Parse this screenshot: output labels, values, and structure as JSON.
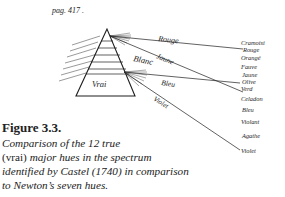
{
  "page_label": "pag. 417 .",
  "diagram": {
    "prism_label": "Vrai",
    "beam_labels": {
      "rouge": "Rouge",
      "jaune": "Jaune",
      "blanc": "Blanc",
      "bleu": "Bleu",
      "violet": "Violet"
    },
    "castel_hues": [
      "Cramoisi",
      "Rouge",
      "Orangé",
      "Fauve",
      "Jaune",
      "Olive",
      "Verd",
      "Celadon",
      "Bleu",
      "Violant",
      "Agathe",
      "Violet"
    ]
  },
  "caption": {
    "title": "Figure 3.3.",
    "line1": "Comparison of the 12 true",
    "line2_upright": "(vrai)",
    "line2_rest": " major hues in the spectrum",
    "line3": "identified by Castel (1740) in comparison",
    "line4": "to Newton’s seven hues."
  },
  "colors": {
    "ink": "#1e1e1e",
    "background": "#ffffff"
  }
}
